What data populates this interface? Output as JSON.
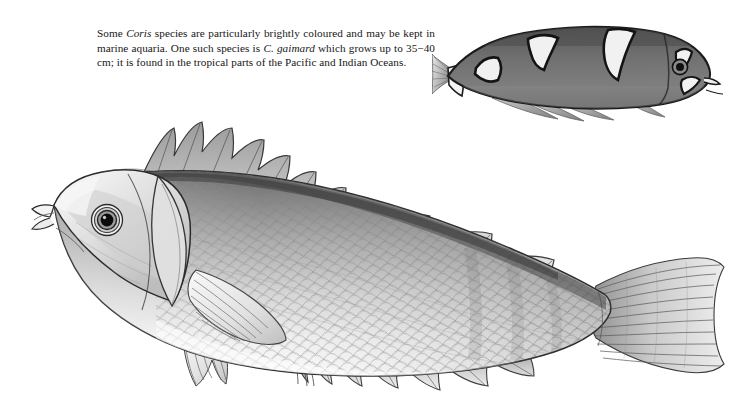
{
  "page": {
    "background_color": "#ffffff",
    "width": 741,
    "height": 418,
    "kind": "natural-history-illustration-plate"
  },
  "caption": {
    "segments": [
      {
        "text": "Some ",
        "style": "roman"
      },
      {
        "text": "Coris",
        "style": "italic"
      },
      {
        "text": " species are particularly brightly coloured and may be kept in marine aquaria. One such species is ",
        "style": "roman"
      },
      {
        "text": "C. gaimard",
        "style": "italic"
      },
      {
        "text": " which grows up to 35−40 cm; it is found in the tropical parts of the Pacific and Indian Oceans.",
        "style": "roman"
      }
    ],
    "plain_text": "Some Coris species are particularly brightly coloured and may be kept in marine aquaria. One such species is C. gaimard which grows up to 35−40 cm; it is found in the tropical parts of the Pacific and Indian Oceans.",
    "line1_a": "Some ",
    "line1_italic": "Coris",
    "line1_b": " species are particularly brightly coloured and may be kept in",
    "line2_a": "marine aquaria. One such species is ",
    "line2_italic": "C. gaimard",
    "line2_b": " which grows up to",
    "line3": "35−40 cm; it is found in the tropical parts of the Pacific and Indian Oceans.",
    "text_color": "#161616"
  },
  "symbols": {
    "male_sign": "♂",
    "male_sign_color": "#5b5b5b"
  },
  "figures": {
    "small_fish": {
      "label": "juvenile-coris-gaimard",
      "orientation": "facing-right",
      "body_color": "#7b7b7b",
      "body_dark": "#4a4a4a",
      "outline_color": "#1d1d1d",
      "marking_color": "#f2f2f2",
      "saddle_count": 3,
      "has_white_tail_band": true,
      "eye_color": "#151515"
    },
    "main_fish": {
      "label": "adult-male-coris-gaimard",
      "orientation": "facing-left",
      "sex": "male",
      "outline_color": "#2a2a2a",
      "body_light": "#fbfbfb",
      "body_mid": "#c9c9c9",
      "body_dark": "#6e6e6e",
      "dorsal_shadow": "#555555",
      "fin_tone": "#d6d6d6",
      "eye_ring_color": "#2b2b2b",
      "eye_pupil_color": "#0d0d0d",
      "scale_tone": "#9a9a9a",
      "fins": [
        "dorsal-fin",
        "pectoral-fin",
        "pelvic-fin",
        "anal-fin",
        "caudal-fin"
      ],
      "dorsal_spine_count": 9,
      "caudal_shape": "truncate"
    }
  }
}
